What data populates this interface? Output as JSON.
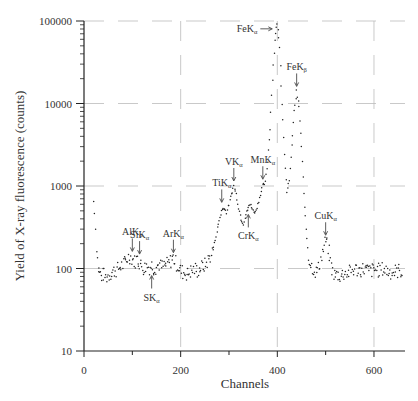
{
  "chart_data": {
    "type": "scatter",
    "title": "",
    "xlabel": "Channels",
    "ylabel": "Yield of X-ray fluorescence (counts)",
    "xlim": [
      0,
      664
    ],
    "ylim": [
      10,
      100000
    ],
    "yscale": "log",
    "grid": true,
    "grid_style": "dashed light gray",
    "legend": null,
    "x_ticks": [
      0,
      200,
      400,
      600
    ],
    "x_tick_labels": [
      "0",
      "200",
      "400",
      "600"
    ],
    "y_ticks": [
      10,
      100,
      1000,
      10000,
      100000
    ],
    "y_tick_labels": [
      "10",
      "100",
      "1000",
      "10000",
      "100000"
    ],
    "series": [
      {
        "name": "XRF spectrum",
        "marker": "dot",
        "color": "#222222",
        "points": [
          [
            20,
            650
          ],
          [
            22,
            480
          ],
          [
            24,
            300
          ],
          [
            26,
            190
          ],
          [
            28,
            130
          ],
          [
            30,
            100
          ],
          [
            33,
            90
          ],
          [
            36,
            80
          ],
          [
            40,
            85
          ],
          [
            45,
            78
          ],
          [
            50,
            82
          ],
          [
            55,
            88
          ],
          [
            60,
            92
          ],
          [
            65,
            95
          ],
          [
            70,
            98
          ],
          [
            75,
            105
          ],
          [
            80,
            110
          ],
          [
            85,
            120
          ],
          [
            90,
            135
          ],
          [
            95,
            140
          ],
          [
            100,
            130
          ],
          [
            105,
            120
          ],
          [
            110,
            132
          ],
          [
            115,
            118
          ],
          [
            120,
            105
          ],
          [
            125,
            100
          ],
          [
            130,
            108
          ],
          [
            135,
            103
          ],
          [
            140,
            110
          ],
          [
            145,
            100
          ],
          [
            150,
            105
          ],
          [
            155,
            112
          ],
          [
            160,
            104
          ],
          [
            165,
            108
          ],
          [
            170,
            110
          ],
          [
            175,
            115
          ],
          [
            180,
            125
          ],
          [
            185,
            135
          ],
          [
            190,
            118
          ],
          [
            195,
            105
          ],
          [
            200,
            95
          ],
          [
            205,
            90
          ],
          [
            210,
            88
          ],
          [
            215,
            85
          ],
          [
            220,
            92
          ],
          [
            225,
            95
          ],
          [
            230,
            98
          ],
          [
            235,
            94
          ],
          [
            240,
            100
          ],
          [
            245,
            105
          ],
          [
            250,
            110
          ],
          [
            255,
            120
          ],
          [
            260,
            135
          ],
          [
            265,
            160
          ],
          [
            270,
            200
          ],
          [
            275,
            280
          ],
          [
            280,
            380
          ],
          [
            285,
            500
          ],
          [
            290,
            550
          ],
          [
            295,
            480
          ],
          [
            300,
            600
          ],
          [
            305,
            800
          ],
          [
            310,
            1000
          ],
          [
            315,
            800
          ],
          [
            320,
            550
          ],
          [
            325,
            400
          ],
          [
            330,
            350
          ],
          [
            335,
            450
          ],
          [
            340,
            550
          ],
          [
            345,
            600
          ],
          [
            350,
            500
          ],
          [
            355,
            480
          ],
          [
            360,
            600
          ],
          [
            365,
            800
          ],
          [
            370,
            1000
          ],
          [
            375,
            1100
          ],
          [
            380,
            2000
          ],
          [
            385,
            5000
          ],
          [
            390,
            20000
          ],
          [
            395,
            60000
          ],
          [
            400,
            95000
          ],
          [
            405,
            50000
          ],
          [
            410,
            10000
          ],
          [
            415,
            2500
          ],
          [
            420,
            800
          ],
          [
            425,
            1200
          ],
          [
            430,
            3000
          ],
          [
            435,
            8000
          ],
          [
            440,
            14000
          ],
          [
            445,
            9000
          ],
          [
            450,
            3000
          ],
          [
            455,
            800
          ],
          [
            460,
            300
          ],
          [
            465,
            140
          ],
          [
            470,
            110
          ],
          [
            475,
            100
          ],
          [
            480,
            90
          ],
          [
            485,
            100
          ],
          [
            490,
            130
          ],
          [
            495,
            170
          ],
          [
            500,
            220
          ],
          [
            505,
            180
          ],
          [
            510,
            120
          ],
          [
            515,
            90
          ],
          [
            520,
            80
          ],
          [
            525,
            85
          ],
          [
            530,
            82
          ],
          [
            540,
            88
          ],
          [
            550,
            90
          ],
          [
            560,
            98
          ],
          [
            570,
            95
          ],
          [
            580,
            100
          ],
          [
            590,
            92
          ],
          [
            600,
            97
          ],
          [
            610,
            95
          ],
          [
            620,
            99
          ],
          [
            630,
            92
          ],
          [
            640,
            90
          ],
          [
            650,
            94
          ],
          [
            660,
            93
          ]
        ]
      }
    ],
    "annotations": [
      {
        "element": "Al",
        "line": "α",
        "text": "AlK",
        "sub": "α",
        "x": 100,
        "y": 140,
        "arrow": "down"
      },
      {
        "element": "Si",
        "line": "α",
        "text": "SiK",
        "sub": "α",
        "x": 115,
        "y": 130,
        "arrow": "down"
      },
      {
        "element": "S",
        "line": "α",
        "text": "SK",
        "sub": "α",
        "x": 140,
        "y": 100,
        "arrow": "up"
      },
      {
        "element": "Ar",
        "line": "α",
        "text": "ArK",
        "sub": "α",
        "x": 185,
        "y": 135,
        "arrow": "down"
      },
      {
        "element": "Ti",
        "line": "α",
        "text": "TiK",
        "sub": "α",
        "x": 285,
        "y": 550,
        "arrow": "down"
      },
      {
        "element": "V",
        "line": "α",
        "text": "VK",
        "sub": "α",
        "x": 310,
        "y": 1000,
        "arrow": "down"
      },
      {
        "element": "Cr",
        "line": "α",
        "text": "CrK",
        "sub": "α",
        "x": 340,
        "y": 550,
        "arrow": "up"
      },
      {
        "element": "Mn",
        "line": "α",
        "text": "MnK",
        "sub": "α",
        "x": 370,
        "y": 1050,
        "arrow": "down"
      },
      {
        "element": "Fe",
        "line": "α",
        "text": "FeK",
        "sub": "α",
        "x": 400,
        "y": 95000,
        "arrow": "right"
      },
      {
        "element": "Fe",
        "line": "β",
        "text": "FeK",
        "sub": "β",
        "x": 440,
        "y": 14000,
        "arrow": "down"
      },
      {
        "element": "Cu",
        "line": "α",
        "text": "CuK",
        "sub": "α",
        "x": 500,
        "y": 220,
        "arrow": "down"
      }
    ]
  }
}
